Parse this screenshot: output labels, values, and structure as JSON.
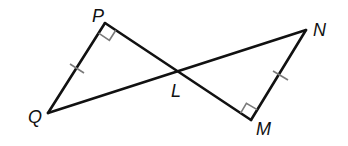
{
  "diagram": {
    "type": "geometry-figure",
    "points": [
      {
        "id": "P",
        "label": "P",
        "x": 105,
        "y": 23,
        "label_x": 92,
        "label_y": 22
      },
      {
        "id": "Q",
        "label": "Q",
        "x": 48,
        "y": 113,
        "label_x": 28,
        "label_y": 123
      },
      {
        "id": "L",
        "label": "L",
        "x": 178,
        "y": 71,
        "label_x": 171,
        "label_y": 97
      },
      {
        "id": "N",
        "label": "N",
        "x": 306,
        "y": 30,
        "label_x": 313,
        "label_y": 36
      },
      {
        "id": "M",
        "label": "M",
        "x": 251,
        "y": 120,
        "label_x": 256,
        "label_y": 135
      }
    ],
    "segments": [
      {
        "from": "P",
        "to": "M",
        "note": "passes through L"
      },
      {
        "from": "Q",
        "to": "N",
        "note": "passes through L"
      },
      {
        "from": "P",
        "to": "Q",
        "tick_marks": 1
      },
      {
        "from": "N",
        "to": "M",
        "tick_marks": 1
      }
    ],
    "right_angles": [
      "P",
      "M"
    ],
    "congruence": "PQ ≅ MN",
    "colors": {
      "line": "#111111",
      "marks": "#7a7a7a",
      "background": "#ffffff"
    }
  }
}
